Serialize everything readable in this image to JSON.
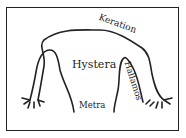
{
  "diagram": {
    "labels": {
      "keration": "Keration",
      "hystera": "Hystera",
      "metra": "Metra",
      "hallamos": "Hallamos"
    },
    "colors": {
      "line": "#222222",
      "background": "#ffffff"
    }
  }
}
